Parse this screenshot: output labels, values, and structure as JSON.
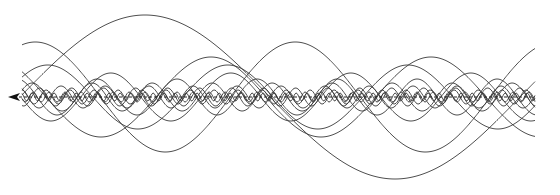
{
  "diagram": {
    "colors": {
      "stroke": "#3a3a3a",
      "axis": "#222222",
      "background": "#ffffff"
    },
    "axis": {
      "y": 97,
      "x_start": 8,
      "x_end": 535,
      "direction": "left"
    },
    "waves": [
      {
        "amplitude": 82,
        "wavelength": 500,
        "phase": 0.0
      },
      {
        "amplitude": 55,
        "wavelength": 260,
        "phase": 1.2
      },
      {
        "amplitude": 40,
        "wavelength": 220,
        "phase": 2.4
      },
      {
        "amplitude": 32,
        "wavelength": 180,
        "phase": 0.6
      },
      {
        "amplitude": 24,
        "wavelength": 120,
        "phase": 3.1
      },
      {
        "amplitude": 18,
        "wavelength": 80,
        "phase": 1.8
      },
      {
        "amplitude": 14,
        "wavelength": 60,
        "phase": 0.3
      },
      {
        "amplitude": 11,
        "wavelength": 44,
        "phase": 2.0
      },
      {
        "amplitude": 9,
        "wavelength": 32,
        "phase": 4.0
      },
      {
        "amplitude": 7,
        "wavelength": 24,
        "phase": 1.0
      },
      {
        "amplitude": 5,
        "wavelength": 16,
        "phase": 2.7
      },
      {
        "amplitude": 4,
        "wavelength": 11,
        "phase": 0.9
      }
    ]
  }
}
